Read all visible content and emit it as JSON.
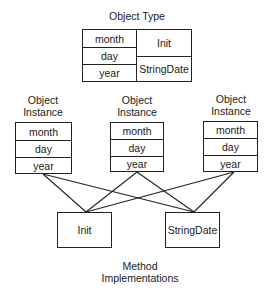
{
  "object_type": {
    "title": "Object Type",
    "fields": [
      "month",
      "day",
      "year"
    ],
    "methods": [
      "Init",
      "StringDate"
    ]
  },
  "instances": [
    {
      "title_line1": "Object",
      "title_line2": "Instance",
      "fields": [
        "month",
        "day",
        "year"
      ]
    },
    {
      "title_line1": "Object",
      "title_line2": "Instance",
      "fields": [
        "month",
        "day",
        "year"
      ]
    },
    {
      "title_line1": "Object",
      "title_line2": "Instance",
      "fields": [
        "month",
        "day",
        "year"
      ]
    }
  ],
  "methods": {
    "items": [
      "Init",
      "StringDate"
    ],
    "caption_line1": "Method",
    "caption_line2": "Implementations"
  },
  "colors": {
    "line": "#222222",
    "background": "#ffffff",
    "text": "#1a1a1a"
  }
}
